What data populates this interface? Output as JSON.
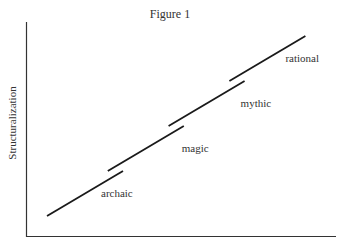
{
  "title": "Figure 1",
  "chart_data": {
    "type": "line",
    "title": "Figure 1",
    "xlabel": "",
    "ylabel": "Structuralization",
    "grid": false,
    "legend": "none",
    "series": [
      {
        "name": "archaic",
        "x": [
          0.0,
          1.0
        ],
        "y": [
          0.0,
          1.0
        ]
      },
      {
        "name": "magic",
        "x": [
          0.8,
          1.8
        ],
        "y": [
          1.0,
          2.0
        ]
      },
      {
        "name": "mythic",
        "x": [
          1.6,
          2.6
        ],
        "y": [
          2.0,
          3.0
        ]
      },
      {
        "name": "rational",
        "x": [
          2.4,
          3.4
        ],
        "y": [
          3.0,
          4.0
        ]
      }
    ],
    "labels": [
      "archaic",
      "magic",
      "mythic",
      "rational"
    ]
  },
  "colors": {
    "line": "#1a1a1a",
    "axis": "#333333",
    "text": "#333333"
  }
}
